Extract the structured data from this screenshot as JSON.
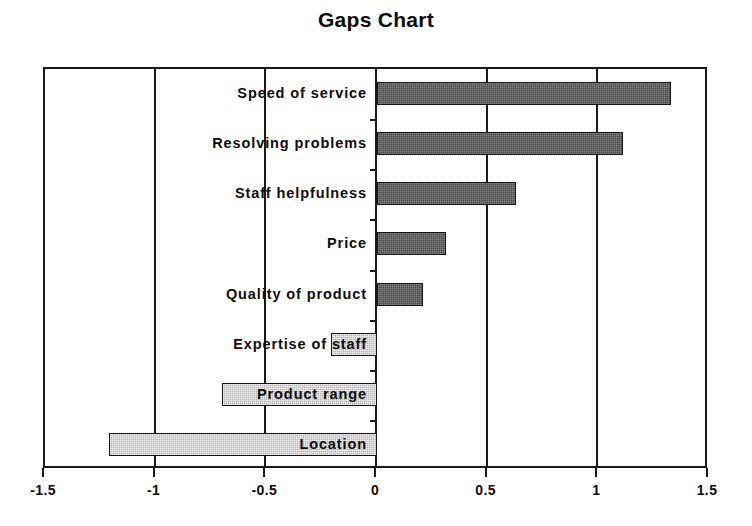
{
  "chart_data": {
    "type": "bar",
    "orientation": "horizontal",
    "title": "Gaps Chart",
    "xlabel": "",
    "ylabel": "",
    "xlim": [
      -1.5,
      1.5
    ],
    "xticks": [
      "-1.5",
      "-1",
      "-0.5",
      "0",
      "0.5",
      "1",
      "1.5"
    ],
    "xtick_values": [
      -1.5,
      -1,
      -0.5,
      0,
      0.5,
      1,
      1.5
    ],
    "grid": true,
    "legend": "none",
    "categories": [
      "Speed of service",
      "Resolving problems",
      "Staff helpfulness",
      "Price",
      "Quality of product",
      "Expertise of staff",
      "Product range",
      "Location"
    ],
    "values": [
      1.33,
      1.11,
      0.63,
      0.31,
      0.21,
      -0.21,
      -0.7,
      -1.21
    ],
    "colors": {
      "positive": "#4a4a4a",
      "negative": "#b3b3b3",
      "axis": "#1a1a1a",
      "text": "#0b0b0b",
      "background": "#ffffff"
    }
  }
}
